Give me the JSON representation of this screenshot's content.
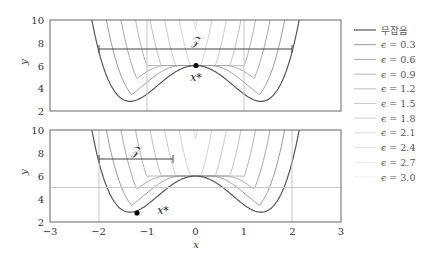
{
  "chart_data": [
    {
      "type": "line",
      "panel": "top",
      "xlabel": "x",
      "ylabel": "y",
      "xlim": [
        -3,
        3
      ],
      "ylim": [
        2,
        10
      ],
      "yticks": [
        2,
        4,
        6,
        8,
        10
      ],
      "annotation_set": "Z",
      "set_interval": [
        -2,
        2
      ],
      "set_label": "𝒵",
      "optimum": {
        "label": "x*",
        "x": 0,
        "y": 6
      },
      "vertical_lines": [
        -2,
        2
      ],
      "horizontal_line": null
    },
    {
      "type": "line",
      "panel": "bottom",
      "xlabel": "x",
      "ylabel": "y",
      "xlim": [
        -3,
        3
      ],
      "ylim": [
        2,
        10
      ],
      "xticks": [
        -3,
        -2,
        -1,
        0,
        1,
        2,
        3
      ],
      "yticks": [
        2,
        4,
        6,
        8,
        10
      ],
      "set_interval": [
        -2,
        -0.5
      ],
      "set_label": "𝒵",
      "optimum": {
        "label": "x*",
        "x": -1.3,
        "y": 2.85
      },
      "vertical_lines": [
        -2,
        2
      ],
      "horizontal_line": 5
    }
  ],
  "legend": {
    "items": [
      {
        "label": "무잡음",
        "color": "#555555",
        "width": 1.2
      },
      {
        "label": "ϵ = 0.3",
        "color": "#9a9a9a"
      },
      {
        "label": "ϵ = 0.6",
        "color": "#a8a8a8"
      },
      {
        "label": "ϵ = 0.9",
        "color": "#b5b5b5"
      },
      {
        "label": "ϵ = 1.2",
        "color": "#c0c0c0"
      },
      {
        "label": "ϵ = 1.5",
        "color": "#cacaca"
      },
      {
        "label": "ϵ = 1.8",
        "color": "#d3d3d3"
      },
      {
        "label": "ϵ = 2.1",
        "color": "#dbdbdb"
      },
      {
        "label": "ϵ = 2.4",
        "color": "#e2e2e2"
      },
      {
        "label": "ϵ = 2.7",
        "color": "#e8e8e8"
      },
      {
        "label": "ϵ = 3.0",
        "color": "#eeeeee"
      }
    ]
  },
  "labels": {
    "x": "x",
    "y": "y",
    "xstar": "x*",
    "set": "𝒵"
  },
  "ticks": {
    "x": [
      "−3",
      "−2",
      "−1",
      "0",
      "1",
      "2",
      "3"
    ],
    "y": [
      "2",
      "4",
      "6",
      "8",
      "10"
    ]
  }
}
